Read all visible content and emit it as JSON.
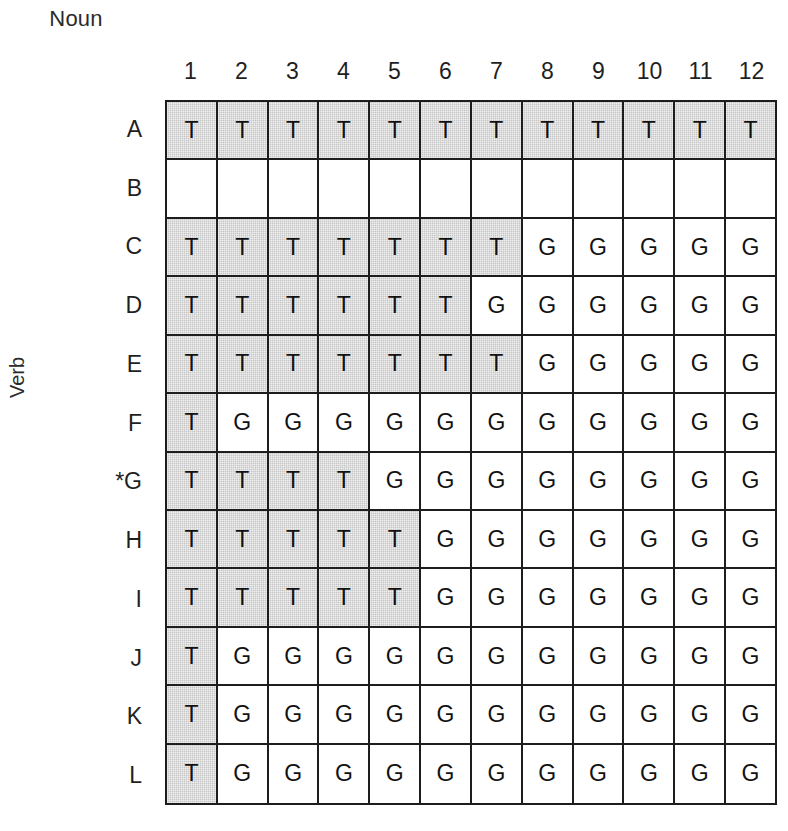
{
  "axes": {
    "x_title": "Noun",
    "y_title": "Verb"
  },
  "chart_data": {
    "type": "heatmap",
    "title": "Noun",
    "xlabel": "Noun",
    "ylabel": "Verb",
    "grid": true,
    "legend": "none",
    "columns": [
      "1",
      "2",
      "3",
      "4",
      "5",
      "6",
      "7",
      "8",
      "9",
      "10",
      "11",
      "12"
    ],
    "rows": [
      "A",
      "B",
      "C",
      "D",
      "E",
      "F",
      "*G",
      "H",
      "I",
      "J",
      "K",
      "L"
    ],
    "cell_states": {
      "T": {
        "label": "T",
        "shaded": true,
        "color": "#c6c6c6"
      },
      "G": {
        "label": "G",
        "shaded": false,
        "color": "#ffffff"
      },
      "": {
        "label": "",
        "shaded": false,
        "color": "#ffffff"
      }
    },
    "values": [
      [
        "T",
        "T",
        "T",
        "T",
        "T",
        "T",
        "T",
        "T",
        "T",
        "T",
        "T",
        "T"
      ],
      [
        "",
        "",
        "",
        "",
        "",
        "",
        "",
        "",
        "",
        "",
        "",
        ""
      ],
      [
        "T",
        "T",
        "T",
        "T",
        "T",
        "T",
        "T",
        "G",
        "G",
        "G",
        "G",
        "G"
      ],
      [
        "T",
        "T",
        "T",
        "T",
        "T",
        "T",
        "G",
        "G",
        "G",
        "G",
        "G",
        "G"
      ],
      [
        "T",
        "T",
        "T",
        "T",
        "T",
        "T",
        "T",
        "G",
        "G",
        "G",
        "G",
        "G"
      ],
      [
        "T",
        "G",
        "G",
        "G",
        "G",
        "G",
        "G",
        "G",
        "G",
        "G",
        "G",
        "G"
      ],
      [
        "T",
        "T",
        "T",
        "T",
        "G",
        "G",
        "G",
        "G",
        "G",
        "G",
        "G",
        "G"
      ],
      [
        "T",
        "T",
        "T",
        "T",
        "T",
        "G",
        "G",
        "G",
        "G",
        "G",
        "G",
        "G"
      ],
      [
        "T",
        "T",
        "T",
        "T",
        "T",
        "G",
        "G",
        "G",
        "G",
        "G",
        "G",
        "G"
      ],
      [
        "T",
        "G",
        "G",
        "G",
        "G",
        "G",
        "G",
        "G",
        "G",
        "G",
        "G",
        "G"
      ],
      [
        "T",
        "G",
        "G",
        "G",
        "G",
        "G",
        "G",
        "G",
        "G",
        "G",
        "G",
        "G"
      ],
      [
        "T",
        "G",
        "G",
        "G",
        "G",
        "G",
        "G",
        "G",
        "G",
        "G",
        "G",
        "G"
      ]
    ]
  }
}
